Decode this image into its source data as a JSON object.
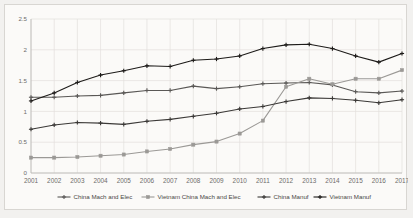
{
  "chart_data": {
    "type": "line",
    "title": "",
    "xlabel": "",
    "ylabel": "",
    "ylim": [
      0,
      2.5
    ],
    "yticks": [
      "0",
      "0.5",
      "1",
      "1.5",
      "2",
      "2.5"
    ],
    "ytick_values": [
      0,
      0.5,
      1,
      1.5,
      2,
      2.5
    ],
    "grid": true,
    "legend_position": "bottom",
    "categories": [
      "2001",
      "2002",
      "2003",
      "2004",
      "2005",
      "2006",
      "2007",
      "2008",
      "2009",
      "2010",
      "2011",
      "2012",
      "2013",
      "2014",
      "2015",
      "2016",
      "2017"
    ],
    "series": [
      {
        "name": "China Mach and Elec",
        "color": "#5a5856",
        "marker": "plus",
        "values": [
          1.23,
          1.23,
          1.25,
          1.26,
          1.3,
          1.34,
          1.34,
          1.41,
          1.37,
          1.4,
          1.45,
          1.46,
          1.47,
          1.43,
          1.32,
          1.3,
          1.33
        ]
      },
      {
        "name": "Vietnam China Mach and Elec",
        "color": "#9b9996",
        "marker": "square",
        "values": [
          0.25,
          0.25,
          0.26,
          0.28,
          0.3,
          0.35,
          0.39,
          0.46,
          0.51,
          0.64,
          0.85,
          1.4,
          1.53,
          1.44,
          1.53,
          1.53,
          1.67
        ]
      },
      {
        "name": "China Manuf",
        "color": "#3b3937",
        "marker": "plus",
        "values": [
          0.71,
          0.78,
          0.82,
          0.81,
          0.79,
          0.84,
          0.87,
          0.92,
          0.97,
          1.04,
          1.08,
          1.16,
          1.22,
          1.21,
          1.18,
          1.14,
          1.19
        ]
      },
      {
        "name": "Vietnam Manuf",
        "color": "#1d1b19",
        "marker": "plus",
        "values": [
          1.17,
          1.3,
          1.47,
          1.59,
          1.66,
          1.74,
          1.73,
          1.83,
          1.85,
          1.9,
          2.02,
          2.08,
          2.09,
          2.02,
          1.9,
          1.8,
          1.94
        ]
      }
    ]
  }
}
